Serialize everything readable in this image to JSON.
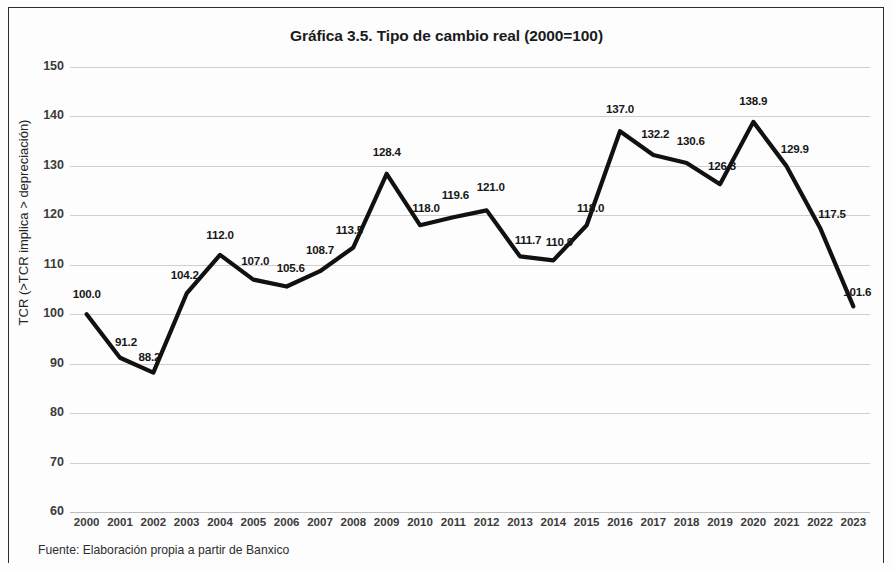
{
  "figure": {
    "title": "Gráfica 3.5. Tipo de cambio real (2000=100)",
    "source_note": "Fuente: Elaboración propia a partir de Banxico"
  },
  "chart_data": {
    "type": "line",
    "title": "Gráfica 3.5. Tipo de cambio real (2000=100)",
    "xlabel": "",
    "ylabel": "TCR (>TCR implica > depreciación)",
    "ylim": [
      60,
      150
    ],
    "yticks": [
      60,
      70,
      80,
      90,
      100,
      110,
      120,
      130,
      140,
      150
    ],
    "grid": true,
    "legend": "none",
    "line_color": "#111111",
    "categories": [
      "2000",
      "2001",
      "2002",
      "2003",
      "2004",
      "2005",
      "2006",
      "2007",
      "2008",
      "2009",
      "2010",
      "2011",
      "2012",
      "2013",
      "2014",
      "2015",
      "2016",
      "2017",
      "2018",
      "2019",
      "2020",
      "2021",
      "2022",
      "2023"
    ],
    "values": [
      100.0,
      91.2,
      88.2,
      104.2,
      112.0,
      107.0,
      105.6,
      108.7,
      113.5,
      128.4,
      118.0,
      119.6,
      121.0,
      111.7,
      110.9,
      118.0,
      137.0,
      132.2,
      130.6,
      126.3,
      138.9,
      129.9,
      117.5,
      101.6
    ],
    "data_labels": [
      "100.0",
      "91.2",
      "88.2",
      "104.2",
      "112.0",
      "107.0",
      "105.6",
      "108.7",
      "113.5",
      "128.4",
      "118.0",
      "119.6",
      "121.0",
      "111.7",
      "110.9",
      "118.0",
      "137.0",
      "132.2",
      "130.6",
      "126.3",
      "138.9",
      "129.9",
      "117.5",
      "101.6"
    ],
    "label_offsets_px": [
      {
        "dx": 0,
        "dy": -14
      },
      {
        "dx": 6,
        "dy": -10
      },
      {
        "dx": -4,
        "dy": -10
      },
      {
        "dx": -2,
        "dy": -12
      },
      {
        "dx": 0,
        "dy": -14
      },
      {
        "dx": 2,
        "dy": -13
      },
      {
        "dx": 4,
        "dy": -13
      },
      {
        "dx": 0,
        "dy": -15
      },
      {
        "dx": -4,
        "dy": -11
      },
      {
        "dx": 0,
        "dy": -16
      },
      {
        "dx": 6,
        "dy": -11
      },
      {
        "dx": 2,
        "dy": -16
      },
      {
        "dx": 4,
        "dy": -17
      },
      {
        "dx": 8,
        "dy": -10
      },
      {
        "dx": 6,
        "dy": -12
      },
      {
        "dx": 4,
        "dy": -11
      },
      {
        "dx": 0,
        "dy": -16
      },
      {
        "dx": 2,
        "dy": -15
      },
      {
        "dx": 4,
        "dy": -16
      },
      {
        "dx": 2,
        "dy": -12
      },
      {
        "dx": 0,
        "dy": -15
      },
      {
        "dx": 8,
        "dy": -11
      },
      {
        "dx": 12,
        "dy": -8
      },
      {
        "dx": 4,
        "dy": -8
      }
    ]
  }
}
